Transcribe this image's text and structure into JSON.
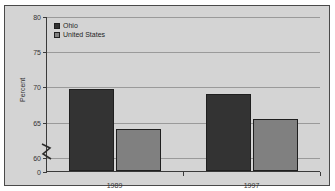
{
  "figure": {
    "title": "Percent ... 1989 and 1997",
    "frame_border_color": "#4a4a4a",
    "plot_background": "#d4d4d4",
    "gridline_color": "#9a9a9a",
    "axis_color": "#3a3a3a"
  },
  "legend": {
    "position": "top-left",
    "entries": [
      {
        "label": "Ohio",
        "color": "#333333"
      },
      {
        "label": "United States",
        "color": "#808080"
      }
    ]
  },
  "axes": {
    "ylabel": "Percent",
    "yticks": [
      "0",
      "60",
      "65",
      "70",
      "75",
      "80"
    ],
    "xticks": [
      "1989",
      "1997"
    ],
    "axis_break": "zigzag"
  },
  "chart_data": {
    "type": "bar",
    "title": "Percent ... 1989 and 1997",
    "xlabel": "",
    "ylabel": "Percent",
    "categories": [
      "1989",
      "1997"
    ],
    "series": [
      {
        "name": "Ohio",
        "color": "#333333",
        "values": [
          69.6,
          69.0
        ]
      },
      {
        "name": "United States",
        "color": "#808080",
        "values": [
          63.9,
          65.4
        ]
      }
    ],
    "ylim": [
      58,
      80
    ],
    "ytick_values": [
      60,
      65,
      70,
      75,
      80
    ],
    "zero_tick": 0,
    "axis_break": true,
    "grid": true,
    "legend_position": "top-left"
  }
}
